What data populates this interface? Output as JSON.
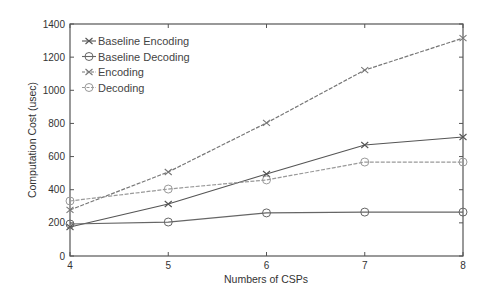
{
  "chart_data": {
    "type": "line",
    "title": "",
    "xlabel": "Numbers of CSPs",
    "ylabel": "Computation Cost (usec)",
    "x": [
      4,
      5,
      6,
      7,
      8
    ],
    "xlim": [
      4,
      8
    ],
    "ylim": [
      0,
      1400
    ],
    "xticks": [
      "4",
      "5",
      "6",
      "7",
      "8"
    ],
    "yticks": [
      "0",
      "200",
      "400",
      "600",
      "800",
      "1000",
      "1200",
      "1400"
    ],
    "grid": false,
    "legend_position": "upper left",
    "series": [
      {
        "name": "Baseline Encoding",
        "marker": "x",
        "line": "solid",
        "color": "#555555",
        "values": [
          175,
          314,
          495,
          670,
          718
        ]
      },
      {
        "name": "Baseline Decoding",
        "marker": "o",
        "line": "solid",
        "color": "#666666",
        "values": [
          193,
          205,
          260,
          265,
          265
        ]
      },
      {
        "name": "Encoding",
        "marker": "x",
        "line": "dashed",
        "color": "#777777",
        "values": [
          278,
          507,
          803,
          1122,
          1315
        ]
      },
      {
        "name": "Decoding",
        "marker": "o",
        "line": "dashed",
        "color": "#999999",
        "values": [
          332,
          404,
          459,
          567,
          567
        ]
      }
    ]
  }
}
